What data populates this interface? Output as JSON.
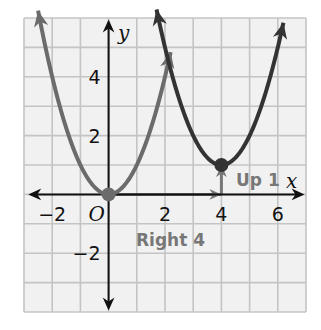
{
  "chart_data": {
    "type": "line",
    "title": "",
    "xlabel": "x",
    "ylabel": "y",
    "xlim": [
      -3,
      7
    ],
    "ylim": [
      -4,
      6
    ],
    "grid": true,
    "x_ticks": [
      {
        "value": -2,
        "label": "−2"
      },
      {
        "value": 0,
        "label": "O"
      },
      {
        "value": 2,
        "label": "2"
      },
      {
        "value": 4,
        "label": "4"
      },
      {
        "value": 6,
        "label": "6"
      }
    ],
    "y_ticks": [
      {
        "value": 4,
        "label": "4"
      },
      {
        "value": 2,
        "label": "2"
      },
      {
        "value": -2,
        "label": "−2"
      }
    ],
    "series": [
      {
        "name": "parent parabola y = x^2",
        "expression": "y = x^2",
        "vertex": [
          0,
          0
        ],
        "x_range": [
          -2.5,
          2.2
        ],
        "color": "#6b6b6b"
      },
      {
        "name": "translated parabola y = (x - 4)^2 + 1",
        "expression": "y = (x - 4)^2 + 1",
        "vertex": [
          4,
          1
        ],
        "x_range": [
          1.7,
          6.2
        ],
        "color": "#333333"
      }
    ],
    "annotations": [
      {
        "text": "Right 4",
        "from": [
          0,
          0
        ],
        "to": [
          4,
          0
        ],
        "color": "#777777"
      },
      {
        "text": "Up 1",
        "from": [
          4,
          0
        ],
        "to": [
          4,
          1
        ],
        "color": "#777777"
      }
    ]
  },
  "labels": {
    "x_axis": "x",
    "y_axis": "y",
    "origin": "O",
    "right_shift": "Right 4",
    "up_shift": "Up 1"
  },
  "colors": {
    "grid": "#c4c4c4",
    "grid_bg": "#f1f1f1",
    "axis": "#111111",
    "parent_curve": "#6b6b6b",
    "translated_curve": "#333333",
    "annotation": "#777777"
  }
}
